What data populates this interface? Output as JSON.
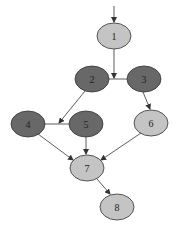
{
  "diagram": {
    "type": "directed-graph",
    "colors": {
      "dark_fill": "#686868",
      "light_fill": "#c4c4c4",
      "stroke": "#333333",
      "label": "#222222"
    },
    "nodes": [
      {
        "id": "1",
        "label": "1",
        "cx": 114,
        "cy": 36,
        "rx": 17,
        "ry": 13,
        "shade": "light"
      },
      {
        "id": "2",
        "label": "2",
        "cx": 92,
        "cy": 79,
        "rx": 17,
        "ry": 13,
        "shade": "dark"
      },
      {
        "id": "3",
        "label": "3",
        "cx": 144,
        "cy": 79,
        "rx": 17,
        "ry": 13,
        "shade": "dark"
      },
      {
        "id": "4",
        "label": "4",
        "cx": 28,
        "cy": 124,
        "rx": 17,
        "ry": 13,
        "shade": "dark"
      },
      {
        "id": "5",
        "label": "5",
        "cx": 86,
        "cy": 124,
        "rx": 17,
        "ry": 13,
        "shade": "dark"
      },
      {
        "id": "6",
        "label": "6",
        "cx": 151,
        "cy": 123,
        "rx": 17,
        "ry": 13,
        "shade": "light"
      },
      {
        "id": "7",
        "label": "7",
        "cx": 87,
        "cy": 168,
        "rx": 17,
        "ry": 13,
        "shade": "light"
      },
      {
        "id": "8",
        "label": "8",
        "cx": 117,
        "cy": 207,
        "rx": 17,
        "ry": 13,
        "shade": "light"
      }
    ],
    "edges": [
      {
        "from": "entry",
        "to": "1",
        "x1": 114,
        "y1": 6,
        "x2": 114,
        "y2": 22,
        "arrow": true
      },
      {
        "from": "2",
        "to": "3",
        "x1": 109,
        "y1": 79,
        "x2": 127,
        "y2": 79,
        "arrow": false
      },
      {
        "from": "1",
        "to": "2-3",
        "x1": 114,
        "y1": 49,
        "x2": 114,
        "y2": 78,
        "arrow": true
      },
      {
        "from": "4",
        "to": "5",
        "x1": 45,
        "y1": 124,
        "x2": 69,
        "y2": 124,
        "arrow": false
      },
      {
        "from": "2",
        "to": "4-5",
        "x1": 85,
        "y1": 91,
        "x2": 59,
        "y2": 123,
        "arrow": true
      },
      {
        "from": "3",
        "to": "6",
        "x1": 143,
        "y1": 92,
        "x2": 150,
        "y2": 109,
        "arrow": true
      },
      {
        "from": "4",
        "to": "7",
        "x1": 38,
        "y1": 134,
        "x2": 73,
        "y2": 160,
        "arrow": true
      },
      {
        "from": "5",
        "to": "7",
        "x1": 86,
        "y1": 137,
        "x2": 86,
        "y2": 154,
        "arrow": true
      },
      {
        "from": "6",
        "to": "7",
        "x1": 141,
        "y1": 133,
        "x2": 101,
        "y2": 160,
        "arrow": true
      },
      {
        "from": "7",
        "to": "8",
        "x1": 97,
        "y1": 179,
        "x2": 110,
        "y2": 194,
        "arrow": true
      }
    ]
  }
}
